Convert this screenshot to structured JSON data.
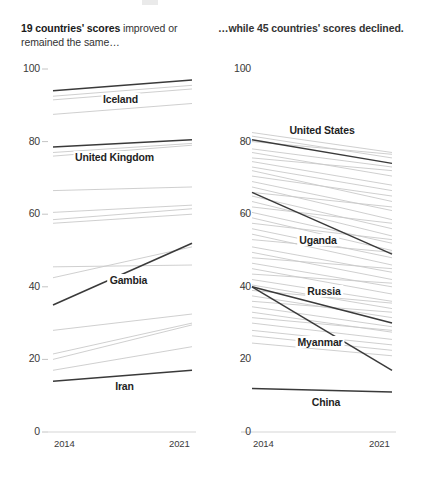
{
  "page": {
    "background": "#ffffff",
    "text_color": "#2b2b2b"
  },
  "panels": {
    "left": {
      "headline_bold": "19 countries' scores",
      "headline_rest": " improved or remained the same…",
      "headline_full": "19 countries' scores improved or remained the same…"
    },
    "right": {
      "headline_full": "…while 45 countries' scores declined."
    }
  },
  "axis": {
    "y_ticks": [
      "100",
      "80",
      "60",
      "40",
      "20",
      "0"
    ],
    "y_values": [
      100,
      80,
      60,
      40,
      20,
      0
    ],
    "x_start_label": "2014",
    "x_end_label": "2021"
  },
  "colors": {
    "highlight_line": "#3a3a3a",
    "background_line": "#c9c9c9",
    "axis_text": "#3a3a3a",
    "label_text": "#1f1f1f"
  },
  "chart_data": [
    {
      "type": "line",
      "subtype": "slopegraph",
      "title": "19 countries' scores improved or remained the same…",
      "xlabel": "",
      "ylabel": "",
      "x": [
        2014,
        2021
      ],
      "xlim": [
        2014,
        2021
      ],
      "ylim": [
        0,
        100
      ],
      "grid": false,
      "legend": "none",
      "annotations": [
        "Iceland",
        "United Kingdom",
        "Gambia",
        "Iran"
      ],
      "highlighted_series": [
        {
          "name": "Iceland",
          "values": [
            94,
            97
          ],
          "label_x": 2017.4,
          "label_y": 91.5
        },
        {
          "name": "United Kingdom",
          "values": [
            78.5,
            80.5
          ],
          "label_x": 2017.1,
          "label_y": 75.5
        },
        {
          "name": "Gambia",
          "values": [
            35,
            52
          ],
          "label_x": 2017.8,
          "label_y": 41.5
        },
        {
          "name": "Iran",
          "values": [
            14,
            17
          ],
          "label_x": 2017.6,
          "label_y": 12.5
        }
      ],
      "background_series": [
        {
          "name": "bg-01",
          "values": [
            92.5,
            95.5
          ]
        },
        {
          "name": "bg-02",
          "values": [
            91.5,
            94.5
          ]
        },
        {
          "name": "bg-03",
          "values": [
            87.5,
            90.5
          ]
        },
        {
          "name": "bg-04",
          "values": [
            77.0,
            79.5
          ]
        },
        {
          "name": "bg-05",
          "values": [
            76.0,
            79.0
          ]
        },
        {
          "name": "bg-06",
          "values": [
            66.5,
            67.5
          ]
        },
        {
          "name": "bg-07",
          "values": [
            60.5,
            62.5
          ]
        },
        {
          "name": "bg-08",
          "values": [
            58.5,
            61.5
          ]
        },
        {
          "name": "bg-09",
          "values": [
            57.5,
            60.0
          ]
        },
        {
          "name": "bg-10",
          "values": [
            45.5,
            46.0
          ]
        },
        {
          "name": "bg-11",
          "values": [
            42.5,
            51.0
          ]
        },
        {
          "name": "bg-12",
          "values": [
            28.0,
            32.5
          ]
        },
        {
          "name": "bg-13",
          "values": [
            21.5,
            30.0
          ]
        },
        {
          "name": "bg-14",
          "values": [
            20.0,
            29.5
          ]
        },
        {
          "name": "bg-15",
          "values": [
            17.0,
            23.5
          ]
        }
      ]
    },
    {
      "type": "line",
      "subtype": "slopegraph",
      "title": "…while 45 countries' scores declined.",
      "xlabel": "",
      "ylabel": "",
      "x": [
        2014,
        2021
      ],
      "xlim": [
        2014,
        2021
      ],
      "ylim": [
        0,
        100
      ],
      "grid": false,
      "legend": "none",
      "annotations": [
        "United States",
        "Uganda",
        "Russia",
        "Myanmar",
        "China"
      ],
      "highlighted_series": [
        {
          "name": "United States",
          "values": [
            80.5,
            74.0
          ],
          "label_x": 2017.5,
          "label_y": 83.0
        },
        {
          "name": "Uganda",
          "values": [
            66.0,
            49.0
          ],
          "label_x": 2017.3,
          "label_y": 52.5
        },
        {
          "name": "Russia",
          "values": [
            40.0,
            30.0
          ],
          "label_x": 2017.6,
          "label_y": 38.5
        },
        {
          "name": "Myanmar",
          "values": [
            40.0,
            17.0
          ],
          "label_x": 2017.4,
          "label_y": 24.5
        },
        {
          "name": "China",
          "values": [
            12.0,
            11.0
          ],
          "label_x": 2017.7,
          "label_y": 8.0
        }
      ],
      "background_series": [
        {
          "name": "bg-01",
          "values": [
            82.5,
            77.0
          ]
        },
        {
          "name": "bg-02",
          "values": [
            81.5,
            75.5
          ]
        },
        {
          "name": "bg-03",
          "values": [
            80.0,
            76.5
          ]
        },
        {
          "name": "bg-04",
          "values": [
            78.0,
            73.0
          ]
        },
        {
          "name": "bg-05",
          "values": [
            77.0,
            70.5
          ]
        },
        {
          "name": "bg-06",
          "values": [
            75.5,
            72.0
          ]
        },
        {
          "name": "bg-07",
          "values": [
            74.5,
            68.0
          ]
        },
        {
          "name": "bg-08",
          "values": [
            73.0,
            66.5
          ]
        },
        {
          "name": "bg-09",
          "values": [
            72.0,
            63.5
          ]
        },
        {
          "name": "bg-10",
          "values": [
            70.5,
            65.0
          ]
        },
        {
          "name": "bg-11",
          "values": [
            69.0,
            61.0
          ]
        },
        {
          "name": "bg-12",
          "values": [
            67.5,
            58.5
          ]
        },
        {
          "name": "bg-13",
          "values": [
            66.0,
            62.0
          ]
        },
        {
          "name": "bg-14",
          "values": [
            65.0,
            56.0
          ]
        },
        {
          "name": "bg-15",
          "values": [
            63.5,
            54.0
          ]
        },
        {
          "name": "bg-16",
          "values": [
            62.0,
            57.5
          ]
        },
        {
          "name": "bg-17",
          "values": [
            60.5,
            52.0
          ]
        },
        {
          "name": "bg-18",
          "values": [
            59.0,
            50.0
          ]
        },
        {
          "name": "bg-19",
          "values": [
            57.5,
            53.0
          ]
        },
        {
          "name": "bg-20",
          "values": [
            56.0,
            48.0
          ]
        },
        {
          "name": "bg-21",
          "values": [
            54.5,
            46.0
          ]
        },
        {
          "name": "bg-22",
          "values": [
            53.0,
            49.5
          ]
        },
        {
          "name": "bg-23",
          "values": [
            51.0,
            44.0
          ]
        },
        {
          "name": "bg-24",
          "values": [
            49.5,
            42.0
          ]
        },
        {
          "name": "bg-25",
          "values": [
            48.0,
            45.0
          ]
        },
        {
          "name": "bg-26",
          "values": [
            46.5,
            40.0
          ]
        },
        {
          "name": "bg-27",
          "values": [
            45.0,
            38.0
          ]
        },
        {
          "name": "bg-28",
          "values": [
            43.5,
            41.0
          ]
        },
        {
          "name": "bg-29",
          "values": [
            42.0,
            36.0
          ]
        },
        {
          "name": "bg-30",
          "values": [
            40.5,
            34.0
          ]
        },
        {
          "name": "bg-31",
          "values": [
            39.0,
            35.5
          ]
        },
        {
          "name": "bg-32",
          "values": [
            37.5,
            31.5
          ]
        },
        {
          "name": "bg-33",
          "values": [
            36.0,
            33.0
          ]
        },
        {
          "name": "bg-34",
          "values": [
            34.5,
            29.0
          ]
        },
        {
          "name": "bg-35",
          "values": [
            33.0,
            27.5
          ]
        },
        {
          "name": "bg-36",
          "values": [
            31.5,
            28.0
          ]
        },
        {
          "name": "bg-37",
          "values": [
            30.0,
            25.5
          ]
        },
        {
          "name": "bg-38",
          "values": [
            28.0,
            24.0
          ]
        },
        {
          "name": "bg-39",
          "values": [
            26.5,
            22.5
          ]
        },
        {
          "name": "bg-40",
          "values": [
            24.5,
            21.0
          ]
        }
      ]
    }
  ]
}
